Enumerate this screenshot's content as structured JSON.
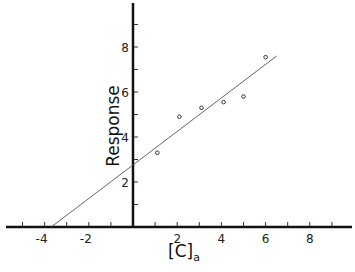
{
  "chart_data": {
    "type": "scatter",
    "title": "",
    "xlabel": "[C]",
    "xlabel_subscript": "a",
    "ylabel": "Response",
    "xlim": [
      -6,
      9.8
    ],
    "ylim": [
      0,
      9.9
    ],
    "grid": false,
    "legend": null,
    "x_ticks": [
      -5,
      -4,
      -3,
      -2,
      -1,
      1,
      2,
      3,
      4,
      5,
      6,
      7,
      8,
      9
    ],
    "x_tick_labels": [
      "-4",
      "-2",
      "2",
      "4",
      "6",
      "8"
    ],
    "x_tick_label_values": [
      -4,
      -2,
      2,
      4,
      6,
      8
    ],
    "y_ticks": [
      1,
      2,
      3,
      4,
      5,
      6,
      7,
      8,
      9
    ],
    "y_tick_labels": [
      "2",
      "4",
      "6",
      "8"
    ],
    "y_tick_label_values": [
      2,
      4,
      6,
      8
    ],
    "series": [
      {
        "name": "data",
        "marker": "open-circle",
        "x": [
          1.1,
          2.1,
          3.1,
          4.1,
          5.0,
          6.0
        ],
        "y": [
          3.3,
          4.9,
          5.3,
          5.55,
          5.8,
          7.55
        ]
      },
      {
        "name": "fit line",
        "type": "line",
        "x": [
          -3.7,
          6.5
        ],
        "y": [
          0,
          7.6
        ],
        "slope": 0.745,
        "intercept": 2.76
      }
    ]
  }
}
